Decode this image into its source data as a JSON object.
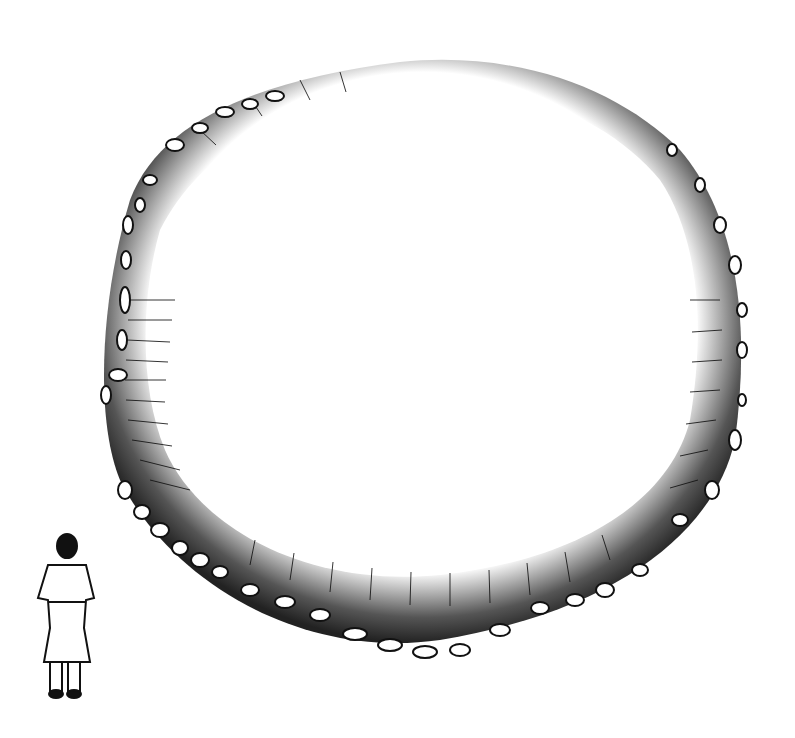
{
  "illustration": {
    "subject": "stone-ringed earthen mound with human figure for scale",
    "style": "black ink line drawing",
    "colors": {
      "ink": "#111111",
      "paper": "#ffffff"
    },
    "mound": {
      "center_x": 425,
      "center_y": 345,
      "rim_stones": "irregular oval stones along outer edge"
    },
    "figure": {
      "position": "lower-left",
      "pose": "standing, viewed from behind"
    }
  }
}
